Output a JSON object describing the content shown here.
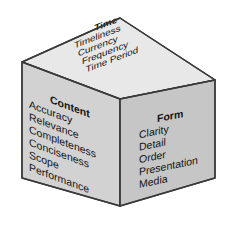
{
  "figure": {
    "name": "information-quality-cube",
    "type": "isometric-cube-diagram",
    "background_color": "#ffffff"
  },
  "faces": {
    "top": {
      "id": "time-face",
      "heading": "Time",
      "fill_color": "#e8e8e8",
      "items": [
        "Timeliness",
        "Currency",
        "Frequency",
        "Time Period"
      ]
    },
    "left": {
      "id": "content-face",
      "heading": "Content",
      "fill_color": "#d2d2d2",
      "items": [
        "Accuracy",
        "Relevance",
        "Completeness",
        "Conciseness",
        "Scope",
        "Performance"
      ]
    },
    "right": {
      "id": "form-face",
      "heading": "Form",
      "fill_color": "#c6c6c6",
      "items": [
        "Clarity",
        "Detail",
        "Order",
        "Presentation",
        "Media"
      ]
    }
  },
  "style": {
    "outline_color": "#3a3a3a",
    "text_color": "#131313"
  }
}
